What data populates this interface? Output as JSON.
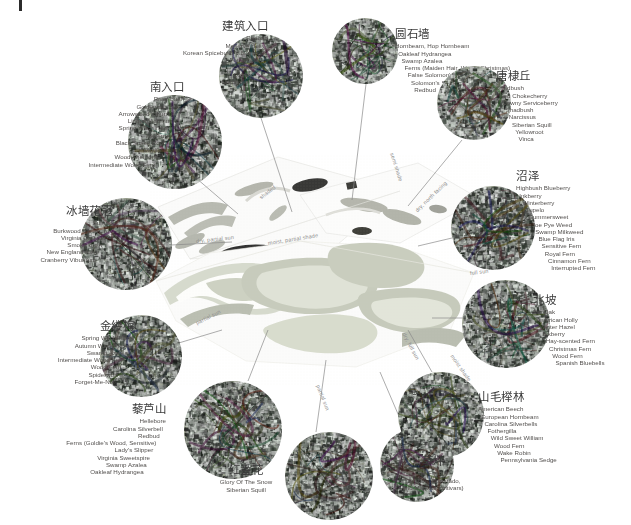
{
  "document": {
    "type": "landscape-planting-plan",
    "center_plan_name": "site-plan"
  },
  "map_notes": [
    {
      "text": "semi shade",
      "x": 392,
      "y": 150,
      "rot": 72
    },
    {
      "text": "shaded",
      "x": 260,
      "y": 195,
      "rot": -38
    },
    {
      "text": "dry, partial sun",
      "x": 196,
      "y": 238,
      "rot": -6
    },
    {
      "text": "moist, partial shade",
      "x": 268,
      "y": 240,
      "rot": -9
    },
    {
      "text": "dry, north facing",
      "x": 416,
      "y": 208,
      "rot": -44
    },
    {
      "text": "full sun",
      "x": 470,
      "y": 270,
      "rot": -7
    },
    {
      "text": "partial sun",
      "x": 196,
      "y": 320,
      "rot": -26
    },
    {
      "text": "full shade",
      "x": 244,
      "y": 388,
      "rot": 70
    },
    {
      "text": "partial sun",
      "x": 318,
      "y": 382,
      "rot": 68
    },
    {
      "text": "dry, full sun",
      "x": 404,
      "y": 330,
      "rot": 62
    },
    {
      "text": "moist shade",
      "x": 452,
      "y": 352,
      "rot": 55
    }
  ],
  "zones": [
    {
      "id": "building-entrance",
      "title": "建筑入口",
      "species": [
        "Redbud",
        "Meserve Holly",
        "Korean Spicebush Viburnum",
        "Fothergilla",
        "Hosta",
        "Daylily",
        "Narcissus"
      ],
      "align": "right",
      "label": {
        "x": 116,
        "y": 20,
        "w": 152
      },
      "circle": {
        "x": 219,
        "y": 34,
        "d": 84
      },
      "leader": {
        "x1": 261,
        "y1": 118,
        "x2": 292,
        "y2": 212
      }
    },
    {
      "id": "stone-wall",
      "title": "圆石墙",
      "species": [
        "Hornbeam, Hop Hornbeam",
        "Oakleaf Hydrangea",
        "Swamp Azalea",
        "Ferns (Maiden Hair, Wood, Christmas)",
        "False Solomon's Seal",
        "Solomon's Seal",
        "Redbud"
      ],
      "align": "left",
      "label": {
        "x": 395,
        "y": 28,
        "w": 150
      },
      "circle": {
        "x": 332,
        "y": 18,
        "d": 66
      },
      "leader": {
        "x1": 366,
        "y1": 84,
        "x2": 352,
        "y2": 200
      }
    },
    {
      "id": "south-entrance",
      "title": "南入口",
      "species": [
        "River Birch",
        "Goldenrain Tree",
        "Arrowwood Viburnum",
        "Linden Viburnum",
        "Spring Witch Hazel",
        "Inkberry",
        "Black Snake Root",
        "Daylily",
        "Wood Anemone",
        "Intermediate Wood Fern"
      ],
      "align": "right",
      "label": {
        "x": 48,
        "y": 81,
        "w": 136
      },
      "circle": {
        "x": 128,
        "y": 95,
        "d": 94
      },
      "leader": {
        "x1": 196,
        "y1": 178,
        "x2": 238,
        "y2": 214
      }
    },
    {
      "id": "shadbush-hill",
      "title": "唐棣丘",
      "species": [
        "Shadbush",
        "Red Chokecherry",
        "Downy Serviceberry",
        "Shadbush",
        "Narcissus",
        "Siberian Squill",
        "Yellowroot",
        "Vinca"
      ],
      "align": "left",
      "label": {
        "x": 496,
        "y": 70,
        "w": 130
      },
      "circle": {
        "x": 437,
        "y": 66,
        "d": 74
      },
      "leader": {
        "x1": 462,
        "y1": 140,
        "x2": 408,
        "y2": 206
      }
    },
    {
      "id": "marsh",
      "title": "沼泽",
      "species": [
        "Highbush Blueberry",
        "Inkberry",
        "Winterberry",
        "Tupelo",
        "Summersweet",
        "Joe Pye Weed",
        "Swamp Milkweed",
        "Blue Flag Iris",
        "Sensitive Fern",
        "Royal Fern",
        "Cinnamon Fern",
        "Interrupted Fern"
      ],
      "align": "left",
      "label": {
        "x": 516,
        "y": 170,
        "w": 114
      },
      "circle": {
        "x": 451,
        "y": 186,
        "d": 84
      },
      "leader": {
        "x1": 452,
        "y1": 238,
        "x2": 418,
        "y2": 246
      }
    },
    {
      "id": "ice-wall-crown",
      "title": "冰墙花冠",
      "species": [
        "Sumac",
        "Burkwood Viburnum",
        "Virginia Creeper",
        "Smoke Bush",
        "New England Aster",
        "Cranberry Viburnum"
      ],
      "align": "right",
      "label": {
        "x": 8,
        "y": 205,
        "w": 104
      },
      "circle": {
        "x": 80,
        "y": 198,
        "d": 92
      },
      "leader": {
        "x1": 171,
        "y1": 245,
        "x2": 232,
        "y2": 242
      }
    },
    {
      "id": "north-slope",
      "title": "北坡",
      "species": [
        "Pin Oak",
        "American Holly",
        "Winter Hazel",
        "Inkberry",
        "Hay-scented Fern",
        "Christmas Fern",
        "Wood Fern",
        "Spanish Bluebells"
      ],
      "align": "left",
      "label": {
        "x": 533,
        "y": 294,
        "w": 96
      },
      "circle": {
        "x": 462,
        "y": 280,
        "d": 88
      },
      "leader": {
        "x1": 470,
        "y1": 318,
        "x2": 432,
        "y2": 318
      }
    },
    {
      "id": "witch-hazel",
      "title": "金缕梅",
      "species": [
        "Spring Witch Hazel",
        "Autumn Witch Hazel",
        "Swamp Azalea",
        "Intermediate Wood Fern",
        "Wood Fern",
        "Spiderwort",
        "Forget-Me-Not"
      ],
      "align": "right",
      "label": {
        "x": 22,
        "y": 320,
        "w": 112
      },
      "circle": {
        "x": 100,
        "y": 315,
        "d": 82
      },
      "leader": {
        "x1": 172,
        "y1": 345,
        "x2": 222,
        "y2": 330
      }
    },
    {
      "id": "hellebore-hill",
      "title": "藜芦山",
      "species": [
        "Hellebore",
        "Carolina Silverbell",
        "Redbud",
        "Ferns (Goldie's Wood, Sensitive)",
        "Lady's Slipper",
        "Virginia Sweetspire",
        "Swamp Azalea",
        "Oakleaf Hydrangea"
      ],
      "align": "right",
      "label": {
        "x": 30,
        "y": 403,
        "w": 136
      },
      "circle": {
        "x": 184,
        "y": 381,
        "d": 98
      },
      "leader": {
        "x1": 248,
        "y1": 381,
        "x2": 268,
        "y2": 330
      }
    },
    {
      "id": "beech-grove",
      "title": "山毛榉林",
      "species": [
        "American Beech",
        "European Hornbeam",
        "Carolina Silverbells",
        "Fothergilla",
        "Wild Sweet William",
        "Wood Fern",
        "Wake Robin",
        "Pennsylvania Sedge"
      ],
      "align": "left",
      "label": {
        "x": 478,
        "y": 391,
        "w": 124
      },
      "circle": {
        "x": 398,
        "y": 372,
        "d": 86
      },
      "leader": {
        "x1": 432,
        "y1": 372,
        "x2": 408,
        "y2": 330
      }
    },
    {
      "id": "crocus",
      "title": "红番花",
      "species": [
        "Glory Of The Snow",
        "Siberian Squill"
      ],
      "align": "center",
      "label": {
        "x": 186,
        "y": 464,
        "w": 120
      },
      "circle": {
        "x": 285,
        "y": 432,
        "d": 88
      },
      "leader": {
        "x1": 316,
        "y1": 432,
        "x2": 326,
        "y2": 360
      }
    },
    {
      "id": "lawn",
      "title": "草坪",
      "species": [
        "Tall Fescue",
        "(Grande, Coronado,",
        "and Matador cultivars)"
      ],
      "align": "center",
      "label": {
        "x": 370,
        "y": 455,
        "w": 126
      },
      "circle": {
        "x": 380,
        "y": 428,
        "d": 74
      },
      "leader": {
        "x1": 404,
        "y1": 428,
        "x2": 380,
        "y2": 372
      }
    }
  ]
}
